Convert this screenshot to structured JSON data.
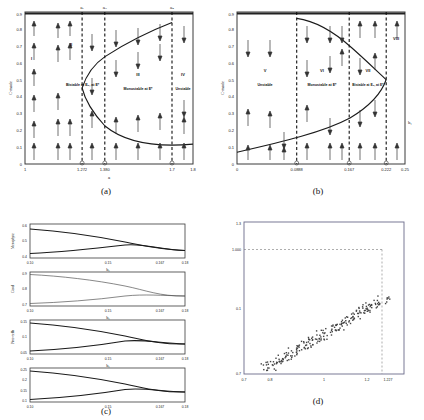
{
  "figure": {
    "panels": [
      "(a)",
      "(b)",
      "(c)",
      "(d)"
    ]
  },
  "captions": {
    "a": "(a)",
    "b": "(b)",
    "c": "(c)",
    "d": "(d)"
  },
  "chart_data": [
    {
      "id": "a",
      "type": "line",
      "title": "",
      "xlabel": "a",
      "ylabel": "C-mode",
      "xlim": [
        1.0,
        1.8
      ],
      "ylim": [
        0.0,
        0.9
      ],
      "xticks": [
        "1",
        "1.272",
        "1.380",
        "1.7",
        "1.8"
      ],
      "xtickvals": [
        1.0,
        1.272,
        1.38,
        1.7,
        1.8
      ],
      "yticks": [
        "0",
        "0.1",
        "0.2",
        "0.3",
        "0.4",
        "0.5",
        "0.6",
        "0.7",
        "0.8",
        "0.9"
      ],
      "ytickvals": [
        0,
        0.1,
        0.2,
        0.3,
        0.4,
        0.5,
        0.6,
        0.7,
        0.8,
        0.9
      ],
      "grid": false,
      "legend": "none",
      "top_markers": [
        {
          "label": "a₁",
          "x": 1.272
        },
        {
          "label": "a₂",
          "x": 1.38
        },
        {
          "label": "a₃",
          "x": 1.7
        }
      ],
      "bottom_markers": [
        {
          "label": "a₁",
          "x": 1.272
        },
        {
          "label": "a₂",
          "x": 1.38
        },
        {
          "label": "a₃",
          "x": 1.7
        }
      ],
      "vertical_lines": [
        1.272,
        1.38,
        1.7
      ],
      "regions": [
        {
          "roman": "I",
          "text": "",
          "x": 1.03,
          "y": 0.72
        },
        {
          "roman": "II",
          "text": "Bistable at E₀, at E*",
          "x": 1.315,
          "y": 0.47
        },
        {
          "roman": "III",
          "text": "Monostable at E*",
          "x": 1.54,
          "y": 0.51
        },
        {
          "roman": "IV",
          "text": "Unstable",
          "x": 1.755,
          "y": 0.51
        }
      ],
      "fold_curve_note": "S-shaped saddle-node fold; left turning point near a=1.272, upper branch rises to y=0.88 at a=1.7, lower branch decreases toward y=0.12 at a=1.8",
      "curve_points_upper": [
        [
          1.272,
          0.45
        ],
        [
          1.29,
          0.52
        ],
        [
          1.32,
          0.59
        ],
        [
          1.36,
          0.645
        ],
        [
          1.41,
          0.69
        ],
        [
          1.47,
          0.735
        ],
        [
          1.54,
          0.775
        ],
        [
          1.6,
          0.81
        ],
        [
          1.66,
          0.85
        ],
        [
          1.7,
          0.882
        ]
      ],
      "curve_points_lower": [
        [
          1.272,
          0.45
        ],
        [
          1.285,
          0.38
        ],
        [
          1.305,
          0.325
        ],
        [
          1.335,
          0.27
        ],
        [
          1.38,
          0.225
        ],
        [
          1.44,
          0.185
        ],
        [
          1.52,
          0.155
        ],
        [
          1.6,
          0.135
        ],
        [
          1.7,
          0.122
        ],
        [
          1.8,
          0.118
        ]
      ],
      "arrow_field_note": "vertical arrows: upward below lower branch and between branches; downward above upper branch"
    },
    {
      "id": "b",
      "type": "line",
      "title": "",
      "xlabel": "b₁",
      "ylabel": "C-mode",
      "xlim": [
        0.0,
        0.25
      ],
      "ylim": [
        0.0,
        0.9
      ],
      "xticks": [
        "0",
        "0.0888",
        "0.167",
        "0.222",
        "0.25"
      ],
      "xtickvals": [
        0.0,
        0.0888,
        0.167,
        0.222,
        0.25
      ],
      "yticks": [
        "0",
        "0.1",
        "0.2",
        "0.3",
        "0.4",
        "0.5",
        "0.6",
        "0.7",
        "0.8",
        "0.9"
      ],
      "ytickvals": [
        0,
        0.1,
        0.2,
        0.3,
        0.4,
        0.5,
        0.6,
        0.7,
        0.8,
        0.9
      ],
      "grid": false,
      "legend": "none",
      "top_markers": [],
      "bottom_markers": [
        {
          "label": "b₁",
          "x": 0.0888
        },
        {
          "label": "b₂",
          "x": 0.167
        },
        {
          "label": "b₃",
          "x": 0.222
        }
      ],
      "vertical_lines": [
        0.0888,
        0.167,
        0.222
      ],
      "regions": [
        {
          "roman": "V",
          "text": "Unstable",
          "x": 0.042,
          "y": 0.52
        },
        {
          "roman": "VI",
          "text": "Monostable at E*",
          "x": 0.128,
          "y": 0.52
        },
        {
          "roman": "VII",
          "text": "Bistable at E₀, at E*",
          "x": 0.195,
          "y": 0.52
        },
        {
          "roman": "VIII",
          "text": "",
          "x": 0.237,
          "y": 0.74
        }
      ],
      "fold_curve_note": "Mirror-image S-curve; upper branch starts at x=0.0888,y=0.86 and bends right to turning point near x=0.222,y=0.50; lower branch descends from turning point toward x=0,y=0.07",
      "curve_points_upper": [
        [
          0.0888,
          0.862
        ],
        [
          0.105,
          0.855
        ],
        [
          0.125,
          0.835
        ],
        [
          0.145,
          0.805
        ],
        [
          0.163,
          0.77
        ],
        [
          0.18,
          0.725
        ],
        [
          0.196,
          0.672
        ],
        [
          0.209,
          0.612
        ],
        [
          0.218,
          0.555
        ],
        [
          0.222,
          0.5
        ]
      ],
      "curve_points_lower": [
        [
          0.222,
          0.5
        ],
        [
          0.219,
          0.44
        ],
        [
          0.213,
          0.385
        ],
        [
          0.203,
          0.33
        ],
        [
          0.189,
          0.282
        ],
        [
          0.17,
          0.238
        ],
        [
          0.146,
          0.195
        ],
        [
          0.115,
          0.155
        ],
        [
          0.075,
          0.115
        ],
        [
          0.035,
          0.088
        ],
        [
          0.0,
          0.07
        ]
      ],
      "arrow_field_note": "vertical arrows indicating flow direction on either side of the fold curve"
    },
    {
      "id": "c",
      "type": "line",
      "title": "",
      "xlabel": "b₁",
      "xlim": [
        0.1,
        0.18
      ],
      "xticks": [
        "0.10",
        "0.15",
        "0.167",
        "0.18"
      ],
      "xtickvals": [
        0.1,
        0.15,
        0.167,
        0.18
      ],
      "grid": false,
      "legend": "none",
      "subplots": [
        {
          "ylabel": "Mesophyte",
          "ylim": [
            0.4,
            0.6
          ],
          "yticks": [
            "0.4",
            "0.5",
            "0.6"
          ],
          "ytickvals": [
            0.4,
            0.5,
            0.6
          ],
          "upper": [
            [
              0.1,
              0.575
            ],
            [
              0.12,
              0.565
            ],
            [
              0.14,
              0.551
            ],
            [
              0.155,
              0.537
            ],
            [
              0.165,
              0.523
            ],
            [
              0.167,
              0.515
            ],
            [
              0.175,
              0.513
            ],
            [
              0.18,
              0.512
            ]
          ],
          "lower": [
            [
              0.1,
              0.425
            ],
            [
              0.12,
              0.443
            ],
            [
              0.14,
              0.465
            ],
            [
              0.155,
              0.487
            ],
            [
              0.165,
              0.506
            ],
            [
              0.167,
              0.515
            ],
            [
              0.175,
              0.513
            ],
            [
              0.18,
              0.512
            ]
          ]
        },
        {
          "ylabel": "Coral",
          "ylim": [
            0.7,
            0.9
          ],
          "yticks": [
            "0.7",
            "0.8",
            "0.9"
          ],
          "ytickvals": [
            0.7,
            0.8,
            0.9
          ],
          "upper": [
            [
              0.1,
              0.885
            ],
            [
              0.12,
              0.878
            ],
            [
              0.14,
              0.866
            ],
            [
              0.155,
              0.848
            ],
            [
              0.165,
              0.827
            ],
            [
              0.167,
              0.818
            ],
            [
              0.175,
              0.816
            ],
            [
              0.18,
              0.815
            ]
          ],
          "lower": [
            [
              0.1,
              0.705
            ],
            [
              0.12,
              0.718
            ],
            [
              0.14,
              0.742
            ],
            [
              0.155,
              0.772
            ],
            [
              0.165,
              0.805
            ],
            [
              0.167,
              0.818
            ],
            [
              0.175,
              0.816
            ],
            [
              0.18,
              0.815
            ]
          ]
        },
        {
          "ylabel": "Pico-cells",
          "ylim": [
            0.05,
            0.15
          ],
          "yticks": [
            "0.05",
            "0.1",
            "0.15"
          ],
          "ytickvals": [
            0.05,
            0.1,
            0.15
          ],
          "upper": [
            [
              0.1,
              0.143
            ],
            [
              0.12,
              0.138
            ],
            [
              0.14,
              0.13
            ],
            [
              0.155,
              0.12
            ],
            [
              0.165,
              0.11
            ],
            [
              0.167,
              0.104
            ],
            [
              0.175,
              0.103
            ],
            [
              0.18,
              0.102
            ]
          ],
          "lower": [
            [
              0.1,
              0.058
            ],
            [
              0.12,
              0.065
            ],
            [
              0.14,
              0.077
            ],
            [
              0.155,
              0.09
            ],
            [
              0.165,
              0.1
            ],
            [
              0.167,
              0.104
            ],
            [
              0.175,
              0.103
            ],
            [
              0.18,
              0.102
            ]
          ]
        },
        {
          "ylabel": "",
          "ylim": [
            0.1,
            0.25
          ],
          "yticks": [
            "0.1",
            "0.15",
            "0.2",
            "0.25"
          ],
          "ytickvals": [
            0.1,
            0.15,
            0.2,
            0.25
          ],
          "upper": [
            [
              0.1,
              0.238
            ],
            [
              0.12,
              0.229
            ],
            [
              0.14,
              0.215
            ],
            [
              0.155,
              0.198
            ],
            [
              0.165,
              0.18
            ],
            [
              0.167,
              0.172
            ],
            [
              0.175,
              0.171
            ],
            [
              0.18,
              0.17
            ]
          ],
          "lower": [
            [
              0.1,
              0.108
            ],
            [
              0.12,
              0.118
            ],
            [
              0.14,
              0.134
            ],
            [
              0.155,
              0.152
            ],
            [
              0.165,
              0.167
            ],
            [
              0.167,
              0.172
            ],
            [
              0.175,
              0.171
            ],
            [
              0.18,
              0.17
            ]
          ]
        }
      ]
    },
    {
      "id": "d",
      "type": "scatter",
      "title": "",
      "xlabel": "",
      "ylabel": "",
      "xlim": [
        0.7,
        1.3
      ],
      "ylim": [
        0.7,
        1.3
      ],
      "xticks": [
        "0.7",
        "0.8",
        "1",
        "1.2",
        "1.227"
      ],
      "xtickvals": [
        0.7,
        0.8,
        1.0,
        1.2,
        1.227
      ],
      "yticks": [
        "0.7",
        "0.1",
        "1.000",
        "1.3"
      ],
      "ytickvals": [
        0.7,
        0.9,
        1.0,
        1.3
      ],
      "grid": false,
      "legend": "none",
      "guides": [
        {
          "type": "horizontal",
          "value": 1.0,
          "label": "1.000"
        },
        {
          "type": "vertical",
          "value": 1.227,
          "label": "1.227"
        }
      ],
      "band_note": "Dense diagonal band of square dots running from (0.76,0.72) up to (1.227,1.000); band width about 0.06 in x",
      "n_points": 220
    }
  ]
}
